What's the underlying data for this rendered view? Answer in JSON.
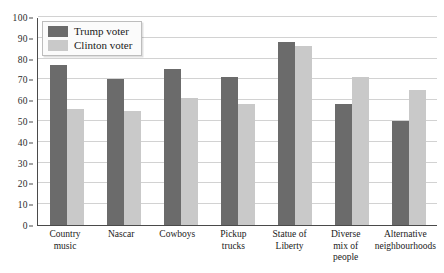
{
  "chart_data": {
    "type": "bar",
    "title": "",
    "subtitle": "",
    "xlabel": "",
    "ylabel": "",
    "ylim": [
      0,
      100
    ],
    "yticks": [
      "0",
      "10",
      "20",
      "30",
      "40",
      "50",
      "60",
      "70",
      "80",
      "90",
      "100"
    ],
    "ytick_values": [
      0,
      10,
      20,
      30,
      40,
      50,
      60,
      70,
      80,
      90,
      100
    ],
    "grid": "horizontal",
    "legend_position": "top-left",
    "categories": [
      "Country music",
      "Nascar",
      "Cowboys",
      "Pickup trucks",
      "Statue of Liberty",
      "Diverse mix of people",
      "Alternative neighbourhoods"
    ],
    "category_lines": [
      [
        "Country",
        "music"
      ],
      [
        "Nascar"
      ],
      [
        "Cowboys"
      ],
      [
        "Pickup",
        "trucks"
      ],
      [
        "Statue of",
        "Liberty"
      ],
      [
        "Diverse",
        "mix of",
        "people"
      ],
      [
        "Alternative",
        "neighbourhoods"
      ]
    ],
    "series": [
      {
        "name": "Trump voter",
        "color": "#6b6b6b",
        "values": [
          77,
          70,
          75,
          71,
          88,
          58,
          50
        ]
      },
      {
        "name": "Clinton voter",
        "color": "#c9c9c9",
        "values": [
          56,
          55,
          61,
          58,
          86,
          71,
          65
        ]
      }
    ]
  },
  "legend": {
    "items": [
      {
        "label": "Trump voter"
      },
      {
        "label": "Clinton voter"
      }
    ]
  },
  "colors": {
    "trump": "#6b6b6b",
    "clinton": "#c9c9c9",
    "axis": "#4a4a4a",
    "grid": "#d2d2d2",
    "background": "#ffffff"
  }
}
